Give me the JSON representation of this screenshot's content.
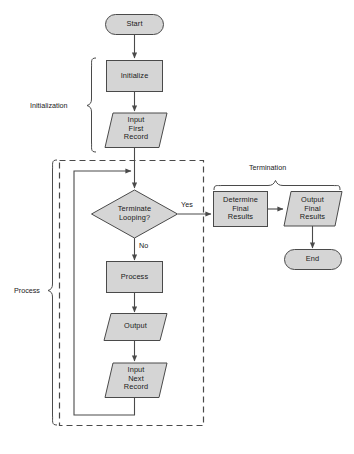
{
  "diagram": {
    "colors": {
      "shape_fill": "#d5d5d5",
      "stroke": "#4a4a4a",
      "text": "#1a1a1a",
      "background": "#ffffff"
    },
    "nodes": [
      {
        "id": "start",
        "type": "terminator",
        "label": "Start"
      },
      {
        "id": "initialize",
        "type": "process",
        "label": "Initialize"
      },
      {
        "id": "input_first",
        "type": "input_output",
        "label": "Input\nFirst\nRecord"
      },
      {
        "id": "terminate_loop",
        "type": "decision",
        "label": "Terminate\nLooping?"
      },
      {
        "id": "process",
        "type": "process",
        "label": "Process"
      },
      {
        "id": "output",
        "type": "input_output",
        "label": "Output"
      },
      {
        "id": "input_next",
        "type": "input_output",
        "label": "Input\nNext\nRecord"
      },
      {
        "id": "determine_final",
        "type": "process",
        "label": "Determine\nFinal\nResults"
      },
      {
        "id": "output_final",
        "type": "input_output",
        "label": "Output\nFinal\nResults"
      },
      {
        "id": "end",
        "type": "terminator",
        "label": "End"
      }
    ],
    "node_labels": {
      "start": "Start",
      "initialize": "Initialize",
      "input_first_line1": "Input",
      "input_first_line2": "First",
      "input_first_line3": "Record",
      "terminate_line1": "Terminate",
      "terminate_line2": "Looping?",
      "process": "Process",
      "output": "Output",
      "input_next_line1": "Input",
      "input_next_line2": "Next",
      "input_next_line3": "Record",
      "determine_line1": "Determine",
      "determine_line2": "Final",
      "determine_line3": "Results",
      "output_final_line1": "Output",
      "output_final_line2": "Final",
      "output_final_line3": "Results",
      "end": "End"
    },
    "edge_labels": {
      "yes": "Yes",
      "no": "No"
    },
    "group_labels": {
      "initialization": "Initialization",
      "process": "Process",
      "termination": "Termination"
    },
    "edges": [
      {
        "from": "start",
        "to": "initialize",
        "label": ""
      },
      {
        "from": "initialize",
        "to": "input_first",
        "label": ""
      },
      {
        "from": "input_first",
        "to": "terminate_loop",
        "label": ""
      },
      {
        "from": "terminate_loop",
        "to": "determine_final",
        "label": "Yes"
      },
      {
        "from": "terminate_loop",
        "to": "process",
        "label": "No"
      },
      {
        "from": "process",
        "to": "output",
        "label": ""
      },
      {
        "from": "output",
        "to": "input_next",
        "label": ""
      },
      {
        "from": "input_next",
        "to": "terminate_loop",
        "label": ""
      },
      {
        "from": "determine_final",
        "to": "output_final",
        "label": ""
      },
      {
        "from": "output_final",
        "to": "end",
        "label": ""
      }
    ]
  }
}
